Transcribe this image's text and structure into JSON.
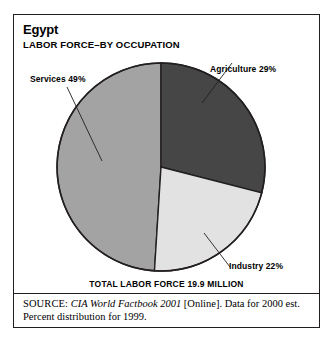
{
  "figure": {
    "country_title": "Egypt",
    "subtitle": "LABOR FORCE–BY OCCUPATION",
    "total_line": "TOTAL LABOR FORCE 19.9 MILLION",
    "labels": {
      "agriculture": "Agriculture 29%",
      "services": "Services 49%",
      "industry": "Industry 22%"
    }
  },
  "source": {
    "kicker": "SOURCE:",
    "work": "CIA World Factbook 2001",
    "rest": " [Online]. Data for 2000 est. Percent distribution for 1999."
  },
  "colors": {
    "agriculture": "#464646",
    "industry": "#e2e2e2",
    "services": "#a3a3a3",
    "outline": "#231f20",
    "background": "#ffffff"
  },
  "chart_data": {
    "type": "pie",
    "title": "Egypt",
    "subtitle": "LABOR FORCE–BY OCCUPATION",
    "categories": [
      "Agriculture",
      "Industry",
      "Services"
    ],
    "values": [
      29,
      22,
      49
    ],
    "value_unit": "percent",
    "data_labels": [
      "Agriculture 29%",
      "Industry 22%",
      "Services 49%"
    ],
    "slice_colors": [
      "#464646",
      "#e2e2e2",
      "#a3a3a3"
    ],
    "start_angle_deg": 0,
    "direction": "clockwise",
    "total_annotation": "TOTAL LABOR FORCE 19.9 MILLION",
    "total_value": 19.9,
    "total_unit": "million workers",
    "legend": "none (direct callout labels with leader lines)",
    "grid": false,
    "xlabel": "",
    "ylabel": ""
  }
}
